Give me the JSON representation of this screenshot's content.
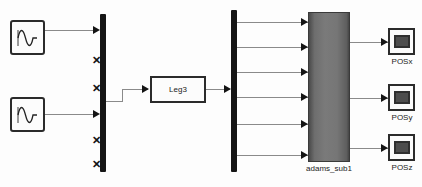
{
  "diagram": {
    "background_color": "#fdfdfd",
    "wire_color": "#8a8a8a",
    "block_border_color": "#2b2b2b",
    "bar_color": "#151515",
    "subsystem_fill": "#6e6e6e"
  },
  "sources": [
    {
      "name": "sine-source-1",
      "icon": "sine-wave-icon",
      "label": ""
    },
    {
      "name": "sine-source-2",
      "icon": "sine-wave-icon",
      "label": ""
    }
  ],
  "mux": {
    "name": "input-mux-bar",
    "port_count": 6,
    "connected_ports": 2,
    "unconnected_marker": "x"
  },
  "leg_block": {
    "label": "Leg3"
  },
  "demux": {
    "name": "output-demux-bar",
    "port_count": 6,
    "input_marker": "arrow"
  },
  "subsystem": {
    "label": "adams_sub1",
    "input_count": 6,
    "output_count": 3
  },
  "scopes": [
    {
      "label": "POSx",
      "icon": "scope-icon"
    },
    {
      "label": "POSy",
      "icon": "scope-icon"
    },
    {
      "label": "POSz",
      "icon": "scope-icon"
    }
  ]
}
